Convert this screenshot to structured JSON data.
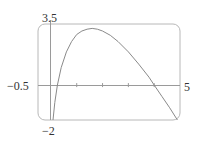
{
  "chart_data": {
    "type": "line",
    "title": "",
    "xlabel": "",
    "ylabel": "",
    "xlim": [
      -0.5,
      5
    ],
    "ylim": [
      -2,
      3.5
    ],
    "grid": false,
    "legend": null,
    "x_ticks": [
      1,
      2,
      3,
      4
    ],
    "window_labels": {
      "x_min": "−0.5",
      "x_max": "5",
      "y_min": "−2",
      "y_max": "3.5"
    },
    "series": [
      {
        "name": "f(x)",
        "x": [
          0.08,
          0.15,
          0.25,
          0.4,
          0.6,
          0.8,
          1.0,
          1.2,
          1.4,
          1.6,
          1.8,
          2.0,
          2.3,
          2.6,
          3.0,
          3.4,
          3.8,
          4.0,
          4.3,
          4.6,
          4.9
        ],
        "y": [
          -2.0,
          -1.0,
          0.0,
          1.0,
          1.9,
          2.5,
          2.9,
          3.1,
          3.2,
          3.25,
          3.2,
          3.1,
          2.85,
          2.5,
          1.9,
          1.2,
          0.45,
          0.0,
          -0.65,
          -1.3,
          -2.0
        ]
      }
    ]
  },
  "colors": {
    "frame": "#b8b8b8",
    "axis": "#9a9a9a",
    "curve": "#8a8a8a",
    "text": "#333333"
  }
}
